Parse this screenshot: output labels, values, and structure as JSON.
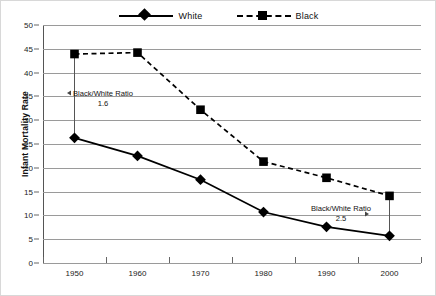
{
  "chart_data": {
    "type": "line",
    "title": "",
    "xlabel": "",
    "ylabel": "Infant Mortality Rate",
    "categories": [
      "1950",
      "1960",
      "1970",
      "1980",
      "1990",
      "2000"
    ],
    "ylim": [
      0,
      50
    ],
    "yticks": [
      0,
      5,
      10,
      15,
      20,
      25,
      30,
      35,
      40,
      45,
      50
    ],
    "grid": true,
    "legend_position": "top-center",
    "series": [
      {
        "name": "White",
        "marker": "diamond",
        "line_style": "solid",
        "color": "#000000",
        "values": [
          26.3,
          22.5,
          17.5,
          10.7,
          7.6,
          5.7
        ]
      },
      {
        "name": "Black",
        "marker": "square",
        "line_style": "dashed",
        "color": "#000000",
        "values": [
          43.9,
          44.2,
          32.2,
          21.3,
          17.9,
          14.1
        ]
      }
    ],
    "annotations": [
      {
        "label": "Black/White Ratio",
        "value": "1.6",
        "at_category": "1950"
      },
      {
        "label": "Black/White Ratio",
        "value": "2.5",
        "at_category": "2000"
      }
    ]
  },
  "legend": {
    "entries": [
      {
        "label": "White"
      },
      {
        "label": "Black"
      }
    ]
  },
  "axes": {
    "y_title": "Infant Mortality Rate",
    "y_labels": [
      "50",
      "45",
      "40",
      "35",
      "30",
      "25",
      "20",
      "15",
      "10",
      "5",
      "0"
    ],
    "x_labels": [
      "1950",
      "1960",
      "1970",
      "1980",
      "1990",
      "2000"
    ]
  }
}
